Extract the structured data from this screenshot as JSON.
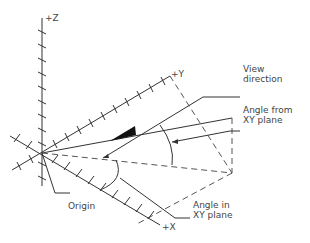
{
  "diagram": {
    "axes": {
      "z_label": "+Z",
      "y_label": "+Y",
      "x_label": "+X"
    },
    "labels": {
      "view_direction": "View\ndirection",
      "angle_from_xy": "Angle from\nXY plane",
      "angle_in_xy": "Angle in\nXY plane",
      "origin": "Origin"
    },
    "colors": {
      "line": "#333333",
      "text": "#444444",
      "background": "#ffffff"
    }
  }
}
